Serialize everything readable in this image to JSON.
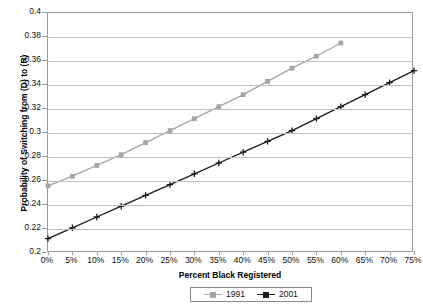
{
  "chart_data": {
    "type": "line",
    "title": "",
    "xlabel": "Percent Black Registered",
    "ylabel": "Probability of Switching from (D) to (R)",
    "xlim": [
      0,
      75
    ],
    "ylim": [
      0.2,
      0.4
    ],
    "xtick_labels": [
      "0%",
      "5%",
      "10%",
      "15%",
      "20%",
      "25%",
      "30%",
      "35%",
      "40%",
      "45%",
      "50%",
      "55%",
      "60%",
      "65%",
      "70%",
      "75%"
    ],
    "ytick_labels": [
      "0.4",
      "0.38",
      "0.36",
      "0.34",
      "0.32",
      "0.3",
      "0.28",
      "0.26",
      "0.24",
      "0.22",
      "0.2"
    ],
    "ytick_values": [
      0.4,
      0.38,
      0.36,
      0.34,
      0.32,
      0.3,
      0.28,
      0.26,
      0.24,
      0.22,
      0.2
    ],
    "grid": true,
    "legend_position": "bottom",
    "series": [
      {
        "name": "1991",
        "color": "#a6a6a6",
        "marker": "square",
        "x": [
          0,
          5,
          10,
          15,
          20,
          25,
          30,
          35,
          40,
          45,
          50,
          55,
          60
        ],
        "values": [
          0.256,
          0.264,
          0.273,
          0.282,
          0.292,
          0.302,
          0.312,
          0.322,
          0.332,
          0.343,
          0.354,
          0.364,
          0.375
        ]
      },
      {
        "name": "2001",
        "color": "#1a1a1a",
        "marker": "plus",
        "x": [
          0,
          5,
          10,
          15,
          20,
          25,
          30,
          35,
          40,
          45,
          50,
          55,
          60,
          65,
          70,
          75
        ],
        "values": [
          0.212,
          0.221,
          0.23,
          0.239,
          0.248,
          0.257,
          0.266,
          0.275,
          0.284,
          0.293,
          0.302,
          0.312,
          0.322,
          0.332,
          0.342,
          0.352
        ]
      }
    ]
  },
  "legend": {
    "entries": [
      {
        "label": "1991"
      },
      {
        "label": "2001"
      }
    ]
  }
}
